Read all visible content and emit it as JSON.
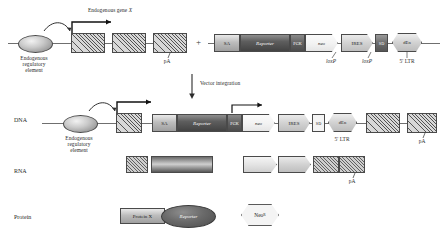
{
  "figure": {
    "type": "gene-trap vector integration schematic",
    "rows": [
      {
        "id": "dna",
        "label": "DNA"
      },
      {
        "id": "rna",
        "label": "RNA"
      },
      {
        "id": "protein",
        "label": "Protein"
      }
    ]
  },
  "top": {
    "gene_title": "Endogenous gene X",
    "gene_title_italic": "X",
    "regulatory_element": {
      "line1": "Endogenous",
      "line2": "regulatory",
      "line3": "element"
    },
    "polyA": "pA",
    "plus": "+",
    "exon_count": 3
  },
  "vector": {
    "elements": [
      {
        "name": "SA",
        "label": "SA",
        "shape": "box",
        "style": "sa"
      },
      {
        "name": "Reporter",
        "label": "Reporter",
        "shape": "box",
        "style": "rep",
        "italic": true
      },
      {
        "name": "PGK",
        "label": "PGK",
        "shape": "box",
        "style": "pgk"
      },
      {
        "name": "neo",
        "label": "neo",
        "shape": "arrow",
        "style": "neo",
        "italic": true
      },
      {
        "name": "IRES",
        "label": "IRES",
        "shape": "arrow",
        "style": "ires"
      },
      {
        "name": "SD",
        "label": "SD",
        "shape": "box",
        "style": "sd"
      },
      {
        "name": "dEn",
        "label": "dEn",
        "shape": "hexagon",
        "style": "ires"
      }
    ],
    "loxP_left": "loxP",
    "loxP_right": "loxP",
    "ltr_label": "5' LTR"
  },
  "arrow": {
    "caption": "Vector integration"
  },
  "dna_row": {
    "regulatory_element": {
      "line1": "Endogenous",
      "line2": "regulatory",
      "line3": "element"
    },
    "ltr_label": "5' LTR",
    "polyA": "pA"
  },
  "rna_row": {
    "polyA": "pA"
  },
  "protein_row": {
    "fusion_box": "Protein X",
    "fusion_oval": "Reporter",
    "neo_protein": "Neo",
    "neo_superscript": "R"
  },
  "colors": {
    "line": "#6f6f6f",
    "stroke": "#4a4a4a",
    "text": "#2a2a2a",
    "reporter_dark": "#4c4c4c",
    "background": "#ffffff"
  }
}
